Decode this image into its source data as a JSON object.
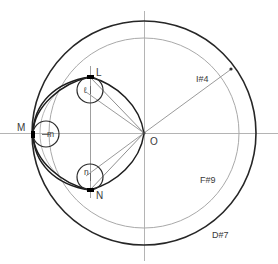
{
  "header": {
    "clipped_text": "ランドを画像描画で黒く塗りつぶす1-1り描く描画例え方"
  },
  "figure": {
    "title": "",
    "center_label": "O",
    "points": [
      {
        "id": "L",
        "label": "L",
        "x": 90,
        "y": 77
      },
      {
        "id": "M",
        "label": "M",
        "x": 33,
        "y": 134
      },
      {
        "id": "N",
        "label": "N",
        "x": 90,
        "y": 190
      }
    ],
    "small_circles": [
      {
        "id": "l",
        "label": "ℓ",
        "cx": 90,
        "cy": 90,
        "r": 13
      },
      {
        "id": "m",
        "label": "m",
        "cx": 46,
        "cy": 134,
        "r": 13
      },
      {
        "id": "n",
        "label": "n",
        "cx": 90,
        "cy": 177,
        "r": 13
      }
    ],
    "outer_circle": {
      "cx": 144,
      "cy": 133,
      "r": 112,
      "color": "#2a2a2a"
    },
    "inner_circle": {
      "cx": 144,
      "cy": 133,
      "r": 95,
      "color": "#9a9a9a"
    },
    "axes": {
      "horizontal_color": "#b0b0b0",
      "vertical_color": "#b0b0b0"
    },
    "tags": [
      {
        "id": "I4",
        "text": "I#4",
        "x": 196,
        "y": 79
      },
      {
        "id": "F9",
        "text": "F#9",
        "x": 200,
        "y": 180
      },
      {
        "id": "D7",
        "text": "D#7",
        "x": 212,
        "y": 235
      }
    ],
    "colors": {
      "curve": "#1f1f1f",
      "guide": "#a8a8a8",
      "radial": "#8d8d8d",
      "chord": "#9a9a9a",
      "point": "#000000",
      "label": "#3a3a3a"
    }
  }
}
